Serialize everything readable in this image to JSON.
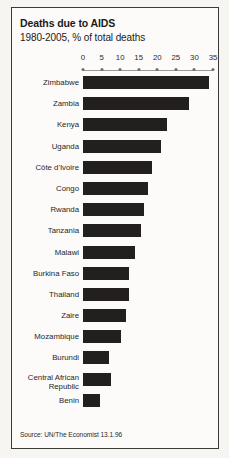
{
  "title": "Deaths due to AIDS",
  "subtitle": "1980-2005, % of total deaths",
  "source": "Source: UN/The Economist 13.1.96",
  "colors": {
    "bar": "#231f1e",
    "frame": "#3a3a38",
    "page": "#f6f5f2",
    "panel": "#fcfbf9",
    "axis": "#9a9a96",
    "text": "#1f1f1e"
  },
  "chart_data": {
    "type": "bar",
    "orientation": "horizontal",
    "title": "Deaths due to AIDS",
    "subtitle": "1980-2005, % of total deaths",
    "xlabel": "% of total deaths",
    "ylabel": "",
    "xlim": [
      0,
      35
    ],
    "xticks": [
      0,
      5,
      10,
      15,
      20,
      25,
      30,
      35
    ],
    "grid": false,
    "legend": false,
    "categories": [
      "Zimbabwe",
      "Zambia",
      "Kenya",
      "Uganda",
      "Côte d'Ivoire",
      "Congo",
      "Rwanda",
      "Tanzania",
      "Malawi",
      "Burkina Faso",
      "Thailand",
      "Zaire",
      "Mozambique",
      "Burundi",
      "Central African\nRepublic",
      "Benin"
    ],
    "values": [
      34.0,
      28.5,
      22.7,
      21.0,
      18.5,
      17.5,
      16.5,
      15.5,
      14.0,
      12.5,
      12.3,
      11.5,
      10.2,
      7.0,
      7.5,
      4.5
    ],
    "source": "Source: UN/The Economist 13.1.96"
  }
}
